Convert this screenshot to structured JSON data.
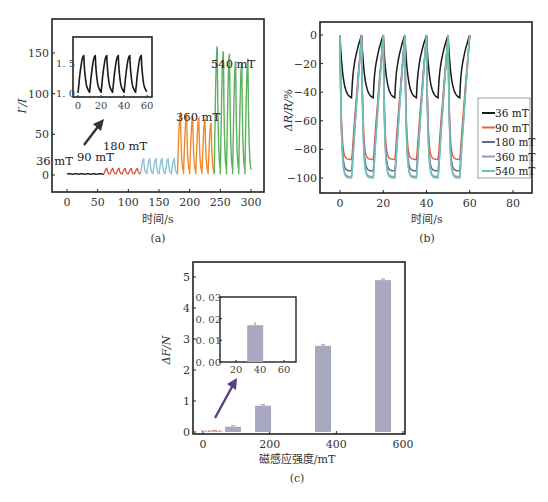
{
  "chart_data": [
    {
      "id": "a",
      "type": "line",
      "caption": "(a)",
      "xlabel": "时间/s",
      "ylabel": "I′/I",
      "xlim": [
        -20,
        330
      ],
      "ylim": [
        -20,
        185
      ],
      "xticks": [
        0,
        50,
        100,
        150,
        200,
        250,
        300
      ],
      "yticks": [
        0,
        50,
        100,
        150
      ],
      "series": [
        {
          "name": "36 mT",
          "color": "#1a1a1a",
          "t_range": [
            0,
            60
          ],
          "peak": 1.6,
          "baseline": 1.0,
          "cycles": 6
        },
        {
          "name": "90 mT",
          "color": "#e0553a",
          "t_range": [
            60,
            120
          ],
          "peak": 8,
          "baseline": 1.0,
          "cycles": 6
        },
        {
          "name": "180 mT",
          "color": "#8fc3d6",
          "t_range": [
            120,
            180
          ],
          "peak": 20,
          "baseline": 1.0,
          "cycles": 6
        },
        {
          "name": "360 mT",
          "color": "#f08a2c",
          "t_range": [
            180,
            240
          ],
          "peaks": [
            76,
            74,
            72,
            70,
            68,
            64
          ],
          "baseline": 1.0,
          "cycles": 6
        },
        {
          "name": "540 mT",
          "color": "#5cb15c",
          "t_range": [
            240,
            300
          ],
          "peaks": [
            158,
            152,
            149,
            140,
            138,
            143
          ],
          "baseline": 1.0,
          "cycles": 6
        }
      ],
      "inset": {
        "xticks": [
          0,
          20,
          40,
          60
        ],
        "yticks": [
          1.0,
          1.5
        ],
        "xlim": [
          -3,
          63
        ],
        "ylim": [
          0.95,
          1.72
        ],
        "cycles": 6,
        "peak": 1.62,
        "baseline": 1.0,
        "color": "#1a1a1a"
      },
      "annotations": [
        "36 mT",
        "90 mT",
        "180 mT",
        "360 mT",
        "540 mT"
      ]
    },
    {
      "id": "b",
      "type": "line",
      "caption": "(b)",
      "xlabel": "时间/s",
      "ylabel": "ΔR/R/%",
      "xlim": [
        -10,
        90
      ],
      "ylim": [
        -110,
        8
      ],
      "xticks": [
        0,
        20,
        40,
        60,
        80
      ],
      "yticks": [
        0,
        -20,
        -40,
        -60,
        -80,
        -100
      ],
      "legend_position": "right",
      "series": [
        {
          "name": "36 mT",
          "color": "#1a1a1a",
          "min": -44,
          "cycles": 6,
          "period": 10
        },
        {
          "name": "90 mT",
          "color": "#e8604a",
          "min": -87,
          "cycles": 6,
          "period": 10
        },
        {
          "name": "180 mT",
          "color": "#5a6d8c",
          "min": -95,
          "cycles": 6,
          "period": 10
        },
        {
          "name": "360 mT",
          "color": "#a58cc8",
          "min": -99,
          "cycles": 6,
          "period": 10
        },
        {
          "name": "540 mT",
          "color": "#6fc4b4",
          "min": -100,
          "cycles": 6,
          "period": 10
        }
      ]
    },
    {
      "id": "c",
      "type": "bar",
      "caption": "(c)",
      "xlabel": "磁感应强度/mT",
      "ylabel": "ΔF/N",
      "xlim": [
        -20,
        605
      ],
      "ylim": [
        -0.05,
        5.4
      ],
      "xticks": [
        0,
        200,
        400,
        600
      ],
      "yticks": [
        0,
        1,
        2,
        3,
        4,
        5
      ],
      "categories": [
        36,
        90,
        180,
        360,
        540
      ],
      "values": [
        0.017,
        0.17,
        0.85,
        2.78,
        4.9
      ],
      "bar_color": "#a8a8c0",
      "inset": {
        "xticks": [
          20,
          40,
          60
        ],
        "yticks": [
          "0.00",
          "0.01",
          "0.02",
          "0.03"
        ],
        "xlim": [
          5,
          65
        ],
        "ylim": [
          0,
          0.03
        ],
        "bar": {
          "x": 36,
          "value": 0.017
        }
      }
    }
  ]
}
